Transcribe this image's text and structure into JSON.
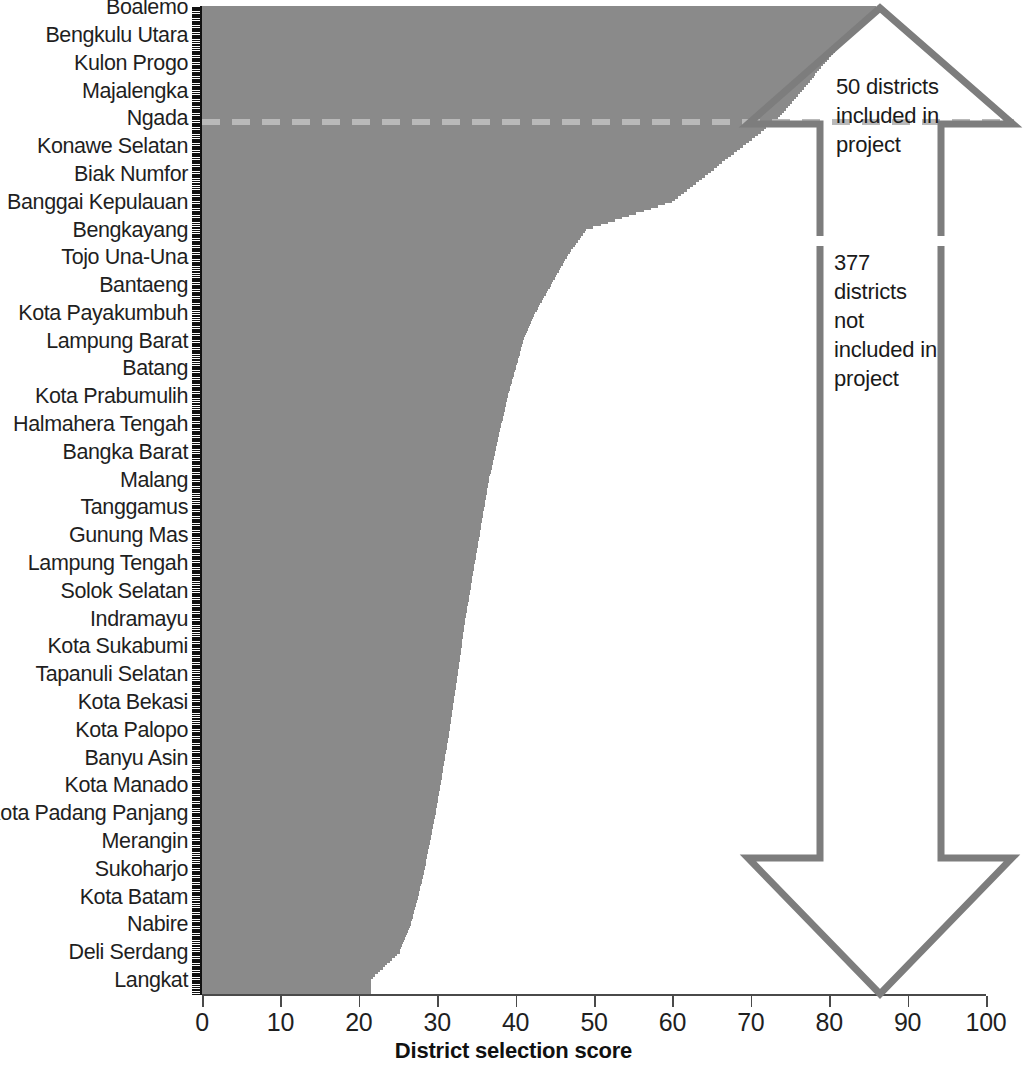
{
  "chart_data": {
    "type": "bar",
    "orientation": "horizontal",
    "title": "",
    "xlabel": "District selection score",
    "ylabel": "",
    "xlim": [
      0,
      100
    ],
    "xticks": [
      0,
      10,
      20,
      30,
      40,
      50,
      60,
      70,
      80,
      90,
      100
    ],
    "grid": false,
    "legend": null,
    "bar_color": "#8a8a8a",
    "total_bars": 427,
    "note": "Each bar is one district, sorted descending by district selection score. Only every 12th district is labelled on the y axis.",
    "threshold": {
      "label": "selection cutoff",
      "after_rank": 50,
      "score": 49,
      "style": "dashed",
      "color": "#b9b9b9"
    },
    "labeled_categories": [
      "Boalemo",
      "Bengkulu Utara",
      "Kulon Progo",
      "Majalengka",
      "Ngada",
      "Konawe Selatan",
      "Biak Numfor",
      "Banggai Kepulauan",
      "Bengkayang",
      "Tojo Una-Una",
      "Bantaeng",
      "Kota Payakumbuh",
      "Lampung Barat",
      "Batang",
      "Kota Prabumulih",
      "Halmahera Tengah",
      "Bangka Barat",
      "Malang",
      "Tanggamus",
      "Gunung Mas",
      "Lampung Tengah",
      "Solok Selatan",
      "Indramayu",
      "Kota Sukabumi",
      "Tapanuli Selatan",
      "Kota Bekasi",
      "Kota Palopo",
      "Banyu Asin",
      "Kota Manado",
      "Kota Padang Panjang",
      "Merangin",
      "Sukoharjo",
      "Kota Batam",
      "Nabire",
      "Deli Serdang",
      "Langkat"
    ],
    "labeled_values": [
      86.0,
      82.5,
      79.5,
      76.5,
      73.5,
      69.0,
      64.5,
      60.0,
      49.0,
      46.5,
      44.5,
      42.5,
      41.0,
      40.0,
      39.0,
      38.2,
      37.4,
      36.6,
      36.0,
      35.4,
      34.8,
      34.2,
      33.6,
      33.1,
      32.6,
      32.1,
      31.6,
      31.0,
      30.4,
      29.8,
      29.1,
      28.4,
      27.6,
      26.6,
      25.2,
      21.5
    ],
    "values_min": 21.5,
    "values_max": 86.0
  },
  "axis": {
    "x_title": "District selection score",
    "tick_labels": [
      "0",
      "10",
      "20",
      "30",
      "40",
      "50",
      "60",
      "70",
      "80",
      "90",
      "100"
    ]
  },
  "annotations": {
    "included": {
      "text": "50 districts\nincluded in\nproject",
      "arrow": "up-arrow",
      "count": "50"
    },
    "excluded": {
      "text": "377\ndistricts\nnot\nincluded in\nproject",
      "arrow": "down-arrow",
      "count": "377"
    },
    "arrow_color": "#7d7d7d"
  }
}
